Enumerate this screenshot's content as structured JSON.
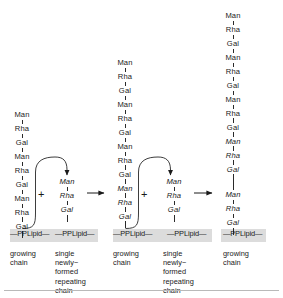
{
  "figure": {
    "type": "biochemistry-pathway-diagram",
    "residues": {
      "man": "Man",
      "rha": "Rha",
      "gal": "Gal"
    },
    "lipid_label": "—PPLipid—",
    "plus_symbol": "+",
    "colors": {
      "background": "#ffffff",
      "ink": "#1a1a1a",
      "membrane_band": "#dcdcdc",
      "rule": "#b9b9b9"
    },
    "columns": [
      {
        "id": "col1",
        "caption": "growing\nchain",
        "chain": [
          {
            "label": "Man",
            "style": "upright"
          },
          {
            "label": "Rha",
            "style": "upright"
          },
          {
            "label": "Gal",
            "style": "upright"
          },
          {
            "label": "Man",
            "style": "upright"
          },
          {
            "label": "Rha",
            "style": "upright"
          },
          {
            "label": "Gal",
            "style": "upright"
          },
          {
            "label": "Man",
            "style": "upright"
          },
          {
            "label": "Rha",
            "style": "upright"
          },
          {
            "label": "Gal",
            "style": "upright"
          }
        ],
        "lipid": "—PPLipid—"
      },
      {
        "id": "col2",
        "caption": "single\nnewly−\nformed\nrepeating\nchain",
        "chain": [
          {
            "label": "Man",
            "style": "italic"
          },
          {
            "label": "Rha",
            "style": "italic"
          },
          {
            "label": "Gal",
            "style": "italic"
          }
        ],
        "lipid": "—PPLipid—"
      },
      {
        "id": "col3",
        "caption": "growing\nchain",
        "chain": [
          {
            "label": "Man",
            "style": "upright"
          },
          {
            "label": "Rha",
            "style": "upright"
          },
          {
            "label": "Gal",
            "style": "upright"
          },
          {
            "label": "Man",
            "style": "upright"
          },
          {
            "label": "Rha",
            "style": "upright"
          },
          {
            "label": "Gal",
            "style": "upright"
          },
          {
            "label": "Man",
            "style": "upright"
          },
          {
            "label": "Rha",
            "style": "upright"
          },
          {
            "label": "Gal",
            "style": "upright"
          },
          {
            "label": "Man",
            "style": "italic"
          },
          {
            "label": "Rha",
            "style": "italic"
          },
          {
            "label": "Gal",
            "style": "italic"
          }
        ],
        "lipid": "—PPLipid—"
      },
      {
        "id": "col4",
        "caption": "single\nnewly−\nformed\nrepeating\nchain",
        "chain": [
          {
            "label": "Man",
            "style": "italic"
          },
          {
            "label": "Rha",
            "style": "italic"
          },
          {
            "label": "Gal",
            "style": "italic"
          }
        ],
        "lipid": "—PPLipid—"
      },
      {
        "id": "col5",
        "caption": "growing\nchain",
        "chain": [
          {
            "label": "Man",
            "style": "upright"
          },
          {
            "label": "Rha",
            "style": "upright"
          },
          {
            "label": "Gal",
            "style": "upright"
          },
          {
            "label": "Man",
            "style": "upright"
          },
          {
            "label": "Rha",
            "style": "upright"
          },
          {
            "label": "Gal",
            "style": "upright"
          },
          {
            "label": "Man",
            "style": "upright"
          },
          {
            "label": "Rha",
            "style": "upright"
          },
          {
            "label": "Gal",
            "style": "upright"
          },
          {
            "label": "Man",
            "style": "italic"
          },
          {
            "label": "Rha",
            "style": "italic"
          },
          {
            "label": "Gal",
            "style": "italic"
          },
          {
            "label": "Man",
            "style": "italic",
            "gap_before": true
          },
          {
            "label": "Rha",
            "style": "italic"
          },
          {
            "label": "Gal",
            "style": "italic"
          }
        ],
        "lipid": "—PPLipid—"
      }
    ],
    "reaction_arrows": [
      {
        "id": "arrow-1-2",
        "kind": "curved-transfer"
      },
      {
        "id": "arrow-step-1",
        "kind": "straight-right"
      },
      {
        "id": "arrow-3-4",
        "kind": "curved-transfer"
      },
      {
        "id": "arrow-step-2",
        "kind": "straight-right"
      }
    ]
  }
}
